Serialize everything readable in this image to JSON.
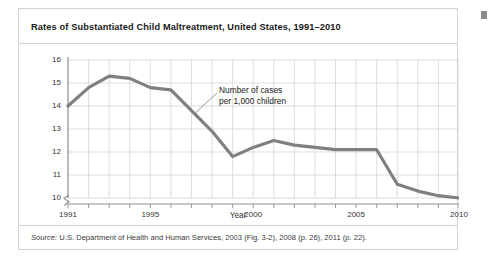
{
  "figure": {
    "title": "Rates of Substantiated Child Maltreatment, United States, 1991–2010",
    "source_label": "Source:",
    "source_text": " U.S. Department of Health and Human Services, 2003 (Fig. 3-2), 2008 (p. 26), 2011 (p. 22).",
    "corner_mark_name": "page-corner-mark"
  },
  "chart_data": {
    "type": "line",
    "title": "Rates of Substantiated Child Maltreatment, United States, 1991–2010",
    "xlabel": "Year",
    "ylabel": "",
    "x": [
      1991,
      1992,
      1993,
      1994,
      1995,
      1996,
      1997,
      1998,
      1999,
      2000,
      2001,
      2002,
      2003,
      2004,
      2005,
      2006,
      2007,
      2008,
      2009,
      2010
    ],
    "values": [
      14.0,
      14.8,
      15.3,
      15.2,
      14.8,
      14.7,
      13.8,
      12.9,
      11.8,
      12.2,
      12.5,
      12.3,
      12.2,
      12.1,
      12.1,
      12.1,
      10.6,
      10.3,
      10.1,
      10.0
    ],
    "series": [
      {
        "name": "Number of cases per 1,000 children",
        "values": [
          14.0,
          14.8,
          15.3,
          15.2,
          14.8,
          14.7,
          13.8,
          12.9,
          11.8,
          12.2,
          12.5,
          12.3,
          12.2,
          12.1,
          12.1,
          12.1,
          10.6,
          10.3,
          10.1,
          10.0
        ]
      }
    ],
    "xlim": [
      1991,
      2010
    ],
    "ylim": [
      10,
      16
    ],
    "y_ticks": [
      "16",
      "15",
      "14",
      "13",
      "12",
      "11",
      "10"
    ],
    "y_tick_values": [
      16,
      15,
      14,
      13,
      12,
      11,
      10
    ],
    "x_ticks": [
      "1991",
      "1995",
      "2000",
      "2005",
      "2010"
    ],
    "x_tick_values": [
      1991,
      1995,
      2000,
      2005,
      2010
    ],
    "grid": true,
    "legend": "none",
    "y_axis_break": true,
    "annotations": [
      {
        "line1": "Number of cases",
        "line2": "per 1,000 children",
        "points_to_year": 1997
      }
    ],
    "colors": {
      "line": "#808080",
      "grid": "#d9d9d9",
      "axis": "#808080",
      "text": "#333333",
      "panel_border": "#d2d2d2"
    }
  },
  "annotation": {
    "line1": "Number of cases",
    "line2": "per 1,000 children"
  },
  "axes": {
    "x_title": "Year",
    "y_ticks": [
      "16",
      "15",
      "14",
      "13",
      "12",
      "11",
      "10"
    ],
    "x_ticks": [
      "1991",
      "1995",
      "2000",
      "2005",
      "2010"
    ]
  }
}
